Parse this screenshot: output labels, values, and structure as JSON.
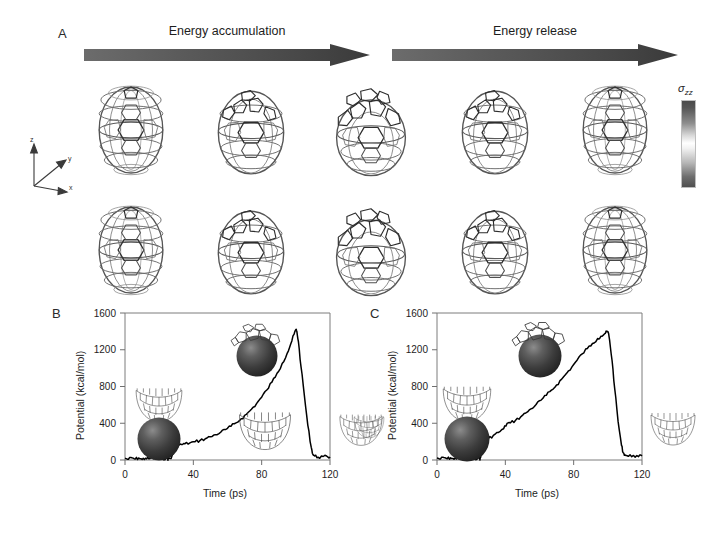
{
  "figure": {
    "panels": [
      {
        "id": "A",
        "label": "A"
      },
      {
        "id": "B",
        "label": "B"
      },
      {
        "id": "C",
        "label": "C"
      }
    ]
  },
  "panel_a": {
    "label": "A",
    "arrows": [
      {
        "name": "energy-accumulation-arrow",
        "label": "Energy accumulation"
      },
      {
        "name": "energy-release-arrow",
        "label": "Energy release"
      }
    ],
    "colorbar": {
      "label": "σ",
      "subscript": "zz",
      "top_color": "#4a4a4a",
      "mid_color": "#ffffff",
      "bottom_color": "#4f4f4f"
    },
    "axis_triad": {
      "z": "z",
      "y": "y",
      "x": "x"
    },
    "structure_rows": [
      {
        "name": "top-row",
        "frames": [
          "frame-1",
          "frame-2",
          "frame-3",
          "frame-4",
          "frame-5"
        ]
      },
      {
        "name": "bottom-row",
        "frames": [
          "frame-6",
          "frame-7",
          "frame-8",
          "frame-9",
          "frame-10"
        ]
      }
    ]
  },
  "chart_data": [
    {
      "type": "line",
      "panel": "B",
      "title": "",
      "xlabel": "Time (ps)",
      "ylabel": "Potential (kcal/mol)",
      "xlim": [
        0,
        120
      ],
      "ylim": [
        0,
        1600
      ],
      "xticks": [
        0,
        40,
        80,
        120
      ],
      "yticks": [
        0,
        400,
        800,
        1200,
        1600
      ],
      "xtick_labels": [
        "0",
        "40",
        "80",
        "120"
      ],
      "ytick_labels": [
        "0",
        "400",
        "800",
        "1200",
        "1600"
      ],
      "grid": false,
      "legend": "none",
      "series": [
        {
          "name": "potential-energy",
          "x": [
            0,
            2,
            4,
            6,
            8,
            10,
            12,
            14,
            16,
            18,
            20,
            22,
            24,
            25,
            25.5,
            27,
            29,
            31,
            33,
            35,
            38,
            41,
            44,
            47,
            50,
            53,
            56,
            59,
            62,
            65,
            68,
            71,
            74,
            77,
            80,
            83,
            86,
            89,
            92,
            95,
            97,
            99,
            100,
            100.6,
            101.5,
            103,
            105,
            107,
            109,
            110,
            111,
            113,
            116,
            119,
            120
          ],
          "y": [
            18,
            8,
            24,
            10,
            22,
            6,
            20,
            12,
            26,
            8,
            18,
            14,
            22,
            10,
            20,
            16,
            150,
            158,
            168,
            176,
            186,
            198,
            214,
            232,
            252,
            276,
            302,
            332,
            366,
            404,
            448,
            496,
            552,
            614,
            684,
            762,
            848,
            944,
            1050,
            1164,
            1262,
            1370,
            1420,
            1400,
            1290,
            1020,
            700,
            380,
            140,
            60,
            44,
            30,
            38,
            28,
            34
          ]
        }
      ],
      "annotations": [
        {
          "name": "inset-sphere-below-cap",
          "desc": "carbon cap above dark sphere"
        },
        {
          "name": "inset-sphere-in-cap",
          "desc": "dark sphere pressed into carbon cap"
        },
        {
          "name": "inset-empty-cap",
          "desc": "empty carbon cap"
        },
        {
          "name": "inset-exterior-cap",
          "desc": "carbon cap outside frame"
        }
      ]
    },
    {
      "type": "line",
      "panel": "C",
      "title": "",
      "xlabel": "Time (ps)",
      "ylabel": "Potential (kcal/mol)",
      "xlim": [
        0,
        120
      ],
      "ylim": [
        0,
        1600
      ],
      "xticks": [
        0,
        40,
        80,
        120
      ],
      "yticks": [
        0,
        400,
        800,
        1200,
        1600
      ],
      "xtick_labels": [
        "0",
        "40",
        "80",
        "120"
      ],
      "ytick_labels": [
        "0",
        "400",
        "800",
        "1200",
        "1600"
      ],
      "grid": false,
      "legend": "none",
      "series": [
        {
          "name": "potential-energy",
          "x": [
            0,
            2,
            4,
            6,
            8,
            10,
            12,
            14,
            16,
            18,
            20,
            22,
            24,
            25,
            25.5,
            27,
            30,
            33,
            36,
            39,
            41,
            43,
            46,
            49,
            52,
            55,
            58,
            61,
            64,
            67,
            70,
            73,
            76,
            79,
            82,
            85,
            88,
            91,
            94,
            96,
            98,
            99.5,
            100.2,
            101,
            102.5,
            104,
            106,
            108,
            109,
            110,
            112,
            115,
            118,
            120
          ],
          "y": [
            22,
            10,
            28,
            14,
            24,
            8,
            26,
            12,
            30,
            10,
            24,
            16,
            26,
            12,
            26,
            200,
            232,
            268,
            300,
            340,
            398,
            404,
            432,
            470,
            512,
            556,
            604,
            652,
            704,
            760,
            816,
            880,
            946,
            1014,
            1086,
            1156,
            1214,
            1268,
            1322,
            1348,
            1372,
            1396,
            1392,
            1310,
            1080,
            780,
            420,
            160,
            80,
            56,
            40,
            50,
            36,
            44
          ]
        }
      ],
      "annotations": [
        {
          "name": "inset-sphere-below-cap",
          "desc": "carbon cap above dark sphere"
        },
        {
          "name": "inset-sphere-in-cap",
          "desc": "dark sphere pressed into carbon cap"
        },
        {
          "name": "inset-empty-cap-right",
          "desc": "empty carbon cap right of frame"
        },
        {
          "name": "inset-empty-cap-left",
          "desc": "empty carbon cap left of frame"
        }
      ]
    }
  ],
  "panel_b": {
    "label": "B"
  },
  "panel_c": {
    "label": "C"
  }
}
